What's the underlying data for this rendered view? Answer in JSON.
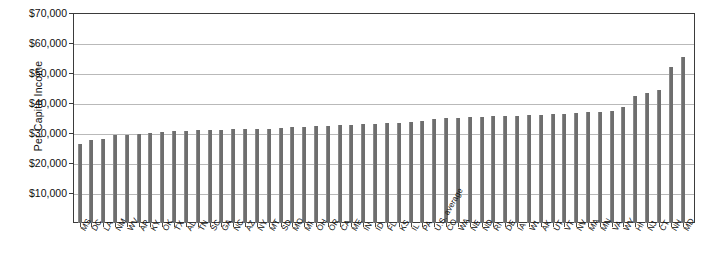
{
  "chart_data": {
    "type": "bar",
    "title": "",
    "xlabel": "",
    "ylabel": "Per Capita Income",
    "ylim": [
      0,
      70000
    ],
    "ytick_values": [
      70000,
      60000,
      50000,
      40000,
      30000,
      20000,
      10000
    ],
    "ytick_labels": [
      "$70,000",
      "$60,000",
      "$50,000",
      "$40,000",
      "$30,000",
      "$20,000",
      "$10,000"
    ],
    "grid": true,
    "legend": "none",
    "bar_color": "#6e6e6e",
    "categories": [
      "MS",
      "DC",
      "LA",
      "NM",
      "WV",
      "AR",
      "KY",
      "OK",
      "TX",
      "AL",
      "TN",
      "SC",
      "GA",
      "NC",
      "AZ",
      "NY",
      "MT",
      "SD",
      "MO",
      "MI",
      "OH",
      "OR",
      "CA",
      "ME",
      "IN",
      "ID",
      "FL",
      "KS",
      "IL",
      "PA",
      "U.S. average",
      "CO",
      "WA",
      "NE",
      "ND",
      "RI",
      "DE",
      "IA",
      "WI",
      "AK",
      "UT",
      "VT",
      "NV",
      "MA",
      "MN",
      "VA",
      "WY",
      "HI",
      "NJ",
      "CT",
      "NH",
      "MD"
    ],
    "values": [
      26500,
      27700,
      28000,
      29300,
      29500,
      29700,
      29900,
      30300,
      30600,
      30700,
      30900,
      31000,
      31100,
      31200,
      31300,
      31400,
      31500,
      31700,
      31900,
      32000,
      32200,
      32400,
      32600,
      32800,
      33000,
      33100,
      33300,
      33500,
      33700,
      34000,
      34700,
      35000,
      35100,
      35300,
      35500,
      35600,
      35700,
      35800,
      35900,
      36100,
      36300,
      36500,
      36700,
      36900,
      37100,
      37300,
      38700,
      42300,
      43500,
      44500,
      52000,
      55500
    ]
  }
}
